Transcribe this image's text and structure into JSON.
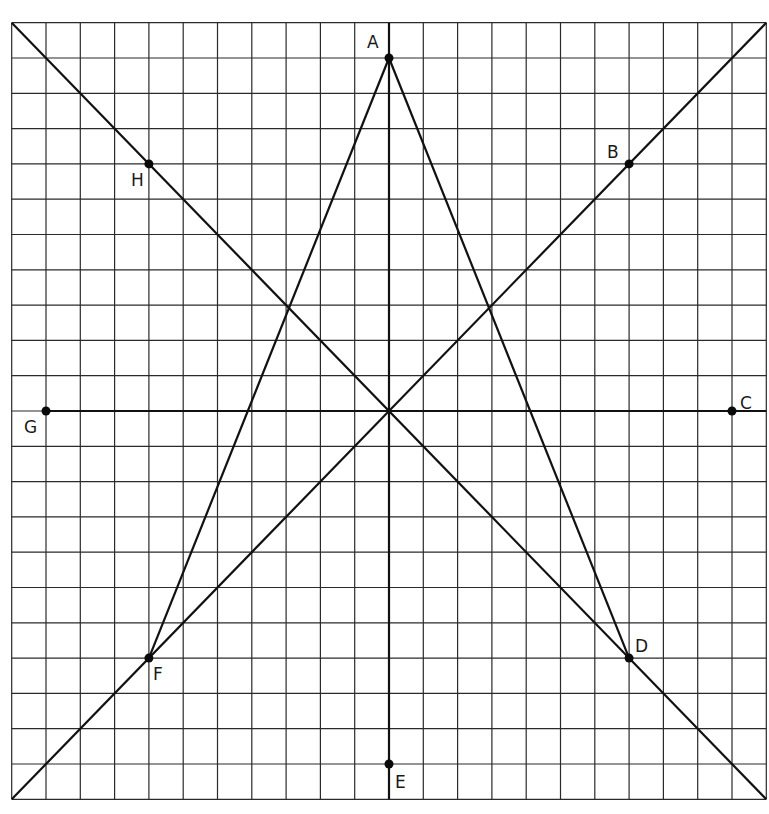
{
  "diagram": {
    "type": "coordinate-grid-geometry",
    "grid": {
      "columns": 22,
      "rows": 22,
      "x_range": [
        -11,
        11
      ],
      "y_range": [
        -11,
        11
      ],
      "line_color": "#2a2a2a"
    },
    "axes": {
      "horizontal": {
        "from": "G",
        "to": "C"
      },
      "vertical": {
        "from": "A",
        "to": "E"
      }
    },
    "points": [
      {
        "label": "A",
        "x": 0,
        "y": 10,
        "label_dx": -22,
        "label_dy": -10
      },
      {
        "label": "B",
        "x": 7,
        "y": 7,
        "label_dx": -22,
        "label_dy": -6
      },
      {
        "label": "C",
        "x": 10,
        "y": 0,
        "label_dx": 8,
        "label_dy": -2
      },
      {
        "label": "D",
        "x": 7,
        "y": -7,
        "label_dx": 6,
        "label_dy": -6
      },
      {
        "label": "E",
        "x": 0,
        "y": -10,
        "label_dx": 6,
        "label_dy": 24
      },
      {
        "label": "F",
        "x": -7,
        "y": -7,
        "label_dx": 4,
        "label_dy": 22
      },
      {
        "label": "G",
        "x": -10,
        "y": 0,
        "label_dx": -22,
        "label_dy": 22
      },
      {
        "label": "H",
        "x": -7,
        "y": 7,
        "label_dx": -18,
        "label_dy": 22
      }
    ],
    "lines": [
      {
        "name": "diagonal-through-H-and-D",
        "from": [
          -11,
          11
        ],
        "to": [
          11,
          -11
        ]
      },
      {
        "name": "diagonal-through-F-and-B",
        "from": [
          -11,
          -11
        ],
        "to": [
          11,
          11
        ]
      },
      {
        "name": "segment-A-D",
        "from": [
          0,
          10
        ],
        "to": [
          7,
          -7
        ]
      },
      {
        "name": "segment-A-F",
        "from": [
          0,
          10
        ],
        "to": [
          -7,
          -7
        ]
      },
      {
        "name": "vertical-axis-A-E",
        "from": [
          0,
          11
        ],
        "to": [
          0,
          -11
        ]
      },
      {
        "name": "horizontal-axis-G-C",
        "from": [
          -10,
          0
        ],
        "to": [
          11,
          0
        ]
      }
    ]
  }
}
